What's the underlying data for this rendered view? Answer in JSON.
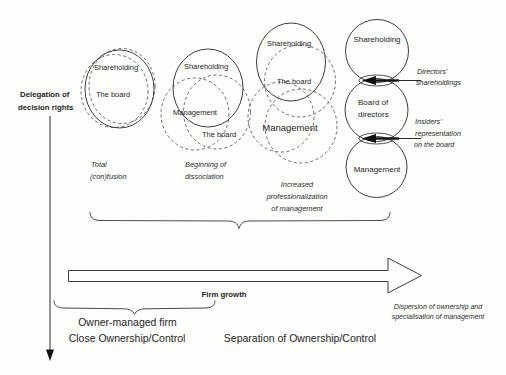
{
  "axis": {
    "delegation_line1": "Delegation of",
    "delegation_line2": "decision rights"
  },
  "clusters": {
    "c1": {
      "shareholding": "Shareholding",
      "board": "The board",
      "caption1": "Total",
      "caption2": "(con)fusion"
    },
    "c2": {
      "shareholding": "Shareholding",
      "management": "Management",
      "board": "The board",
      "caption1": "Beginning of",
      "caption2": "dissociation"
    },
    "c3": {
      "shareholding": "Shareholding",
      "board": "The board",
      "management": "Management",
      "caption1": "Increased",
      "caption2": "professionalization",
      "caption3": "of management"
    },
    "c4": {
      "shareholding": "Shareholding",
      "board_line1": "Board of",
      "board_line2": "directors",
      "management": "Management"
    }
  },
  "annotations": {
    "directors_line1": "Directors’",
    "directors_line2": "shareholdings",
    "insiders_line1": "Insiders’",
    "insiders_line2": "representation",
    "insiders_line3": "on the board"
  },
  "growth": {
    "label": "Firm growth"
  },
  "bottom": {
    "owner_managed": "Owner-managed firm",
    "close_ownership": "Close Ownership/Control",
    "separation": "Separation of Ownership/Control",
    "dispersion_line1": "Dispersion of ownership and",
    "dispersion_line2": "specialisation of management"
  },
  "colors": {
    "ink": "#2b2b2b",
    "background": "#fdfdfc"
  }
}
